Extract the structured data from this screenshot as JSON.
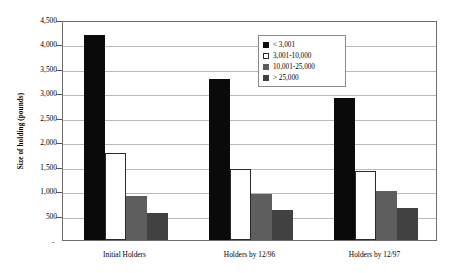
{
  "chart_data": {
    "type": "bar",
    "title": "",
    "xlabel": "",
    "ylabel": "Size of holding (pounds)",
    "categories": [
      "Initial Holders",
      "Holders by 12/96",
      "Holders by 12/97"
    ],
    "series": [
      {
        "name": "< 3,001",
        "values": [
          4200,
          3300,
          2900
        ],
        "color": "#0a0a0a"
      },
      {
        "name": "3,001-10,000",
        "values": [
          1790,
          1450,
          1410
        ],
        "color": "#ffffff"
      },
      {
        "name": "10,001-25,000",
        "values": [
          900,
          950,
          1000
        ],
        "color": "#5e5e5e"
      },
      {
        "name": "> 25,000",
        "values": [
          545,
          605,
          645
        ],
        "color": "#414141"
      }
    ],
    "ylim": [
      0,
      4500
    ],
    "ytick_labels": [
      "4,500",
      "4,000",
      "3,500",
      "3,000",
      "2,500",
      "2,000",
      "1,500",
      "1,000",
      "500",
      "-"
    ],
    "ytick_values": [
      4500,
      4000,
      3500,
      3000,
      2500,
      2000,
      1500,
      1000,
      500,
      0
    ],
    "grid": true,
    "legend_position": "top-center-right"
  },
  "legend": {
    "items": [
      {
        "label": "< 3,001"
      },
      {
        "label": "3,001-10,000"
      },
      {
        "label": "10,001-25,000"
      },
      {
        "label": "> 25,000"
      }
    ]
  },
  "axis": {
    "zero_marker": "-"
  }
}
